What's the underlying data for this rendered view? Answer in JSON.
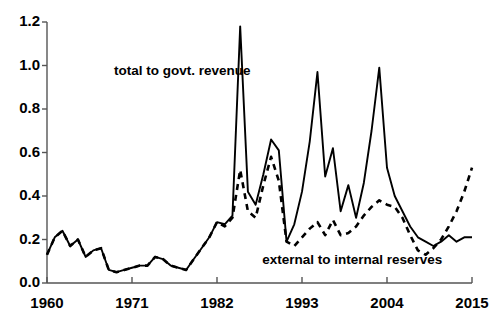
{
  "chart_data": {
    "type": "line",
    "title": "",
    "xlabel": "",
    "ylabel": "",
    "xlim": [
      1960,
      2015
    ],
    "ylim": [
      0.0,
      1.2
    ],
    "grid": false,
    "legend_position": "inline-annotations",
    "xticks": [
      1960,
      1971,
      1982,
      1993,
      2004,
      2015
    ],
    "xtick_labels": [
      "1960",
      "1971",
      "1982",
      "1993",
      "2004",
      "2015"
    ],
    "yticks": [
      0.0,
      0.2,
      0.4,
      0.6,
      0.8,
      1.0,
      1.2
    ],
    "ytick_labels": [
      "0.0",
      "0.2",
      "0.4",
      "0.6",
      "0.8",
      "1.0",
      "1.2"
    ],
    "annotations": [
      {
        "text": "total to govt. revenue",
        "x": 1977.5,
        "y": 0.97
      },
      {
        "text": "external to internal reserves",
        "x": 1999.5,
        "y": 0.1
      }
    ],
    "series": [
      {
        "name": "total to govt. revenue",
        "style": "solid",
        "color": "#000000",
        "x": [
          1960,
          1961,
          1962,
          1963,
          1964,
          1965,
          1966,
          1967,
          1968,
          1969,
          1970,
          1971,
          1972,
          1973,
          1974,
          1975,
          1976,
          1977,
          1978,
          1979,
          1980,
          1981,
          1982,
          1983,
          1984,
          1985,
          1986,
          1987,
          1988,
          1989,
          1990,
          1991,
          1992,
          1993,
          1994,
          1995,
          1996,
          1997,
          1998,
          1999,
          2000,
          2001,
          2002,
          2003,
          2004,
          2005,
          2006,
          2007,
          2008,
          2009,
          2010,
          2011,
          2012,
          2013,
          2014,
          2015
        ],
        "values": [
          0.13,
          0.21,
          0.24,
          0.17,
          0.2,
          0.12,
          0.15,
          0.16,
          0.06,
          0.05,
          0.06,
          0.07,
          0.08,
          0.08,
          0.12,
          0.11,
          0.08,
          0.07,
          0.06,
          0.11,
          0.16,
          0.21,
          0.28,
          0.27,
          0.31,
          1.18,
          0.42,
          0.36,
          0.5,
          0.66,
          0.61,
          0.19,
          0.27,
          0.42,
          0.65,
          0.97,
          0.49,
          0.62,
          0.33,
          0.45,
          0.3,
          0.46,
          0.7,
          0.99,
          0.53,
          0.4,
          0.33,
          0.26,
          0.21,
          0.19,
          0.17,
          0.19,
          0.22,
          0.19,
          0.21,
          0.21
        ]
      },
      {
        "name": "external to internal reserves",
        "style": "dashed",
        "color": "#000000",
        "x": [
          1960,
          1961,
          1962,
          1963,
          1964,
          1965,
          1966,
          1967,
          1968,
          1969,
          1970,
          1971,
          1972,
          1973,
          1974,
          1975,
          1976,
          1977,
          1978,
          1979,
          1980,
          1981,
          1982,
          1983,
          1984,
          1985,
          1986,
          1987,
          1988,
          1989,
          1990,
          1991,
          1992,
          1993,
          1994,
          1995,
          1996,
          1997,
          1998,
          1999,
          2000,
          2001,
          2002,
          2003,
          2004,
          2005,
          2006,
          2007,
          2008,
          2009,
          2010,
          2011,
          2012,
          2013,
          2014,
          2015
        ],
        "values": [
          0.13,
          0.21,
          0.24,
          0.17,
          0.2,
          0.12,
          0.15,
          0.16,
          0.06,
          0.05,
          0.06,
          0.07,
          0.08,
          0.08,
          0.12,
          0.11,
          0.08,
          0.07,
          0.06,
          0.11,
          0.16,
          0.21,
          0.28,
          0.26,
          0.3,
          0.52,
          0.33,
          0.3,
          0.45,
          0.58,
          0.47,
          0.19,
          0.17,
          0.21,
          0.25,
          0.28,
          0.22,
          0.29,
          0.22,
          0.23,
          0.26,
          0.31,
          0.35,
          0.38,
          0.36,
          0.35,
          0.3,
          0.22,
          0.15,
          0.13,
          0.16,
          0.2,
          0.26,
          0.33,
          0.42,
          0.53
        ]
      }
    ]
  }
}
